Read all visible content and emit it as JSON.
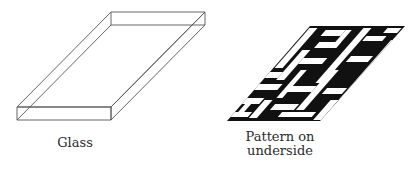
{
  "figures": [
    {
      "id": "glass",
      "label": "Glass",
      "shape": "rectangular glass slab in oblique view",
      "stroke_color": "#555555"
    },
    {
      "id": "pattern",
      "label_line1": "Pattern on",
      "label_line2": "underside",
      "shape": "parallelogram with black-and-white maze-like pattern",
      "fill_color": "#111111"
    }
  ]
}
